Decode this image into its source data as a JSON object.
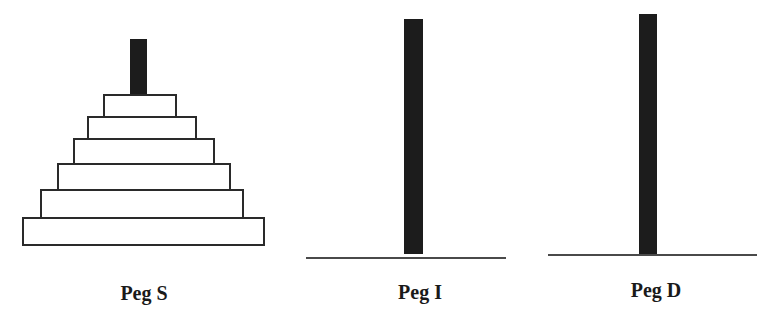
{
  "diagram": {
    "type": "tower-of-hanoi",
    "colors": {
      "peg": "#1c1c1c",
      "disk_border": "#2a2a2a",
      "disk_fill": "#ffffff",
      "base_line": "#4a4a4a",
      "label": "#1a1a1a"
    },
    "pegs": [
      {
        "id": "S",
        "label": "Peg S",
        "disk_count": 6,
        "disks": [
          {
            "order": 1,
            "size": "smallest"
          },
          {
            "order": 2
          },
          {
            "order": 3
          },
          {
            "order": 4
          },
          {
            "order": 5
          },
          {
            "order": 6,
            "size": "largest"
          }
        ]
      },
      {
        "id": "I",
        "label": "Peg I",
        "disk_count": 0,
        "disks": []
      },
      {
        "id": "D",
        "label": "Peg D",
        "disk_count": 0,
        "disks": []
      }
    ]
  }
}
